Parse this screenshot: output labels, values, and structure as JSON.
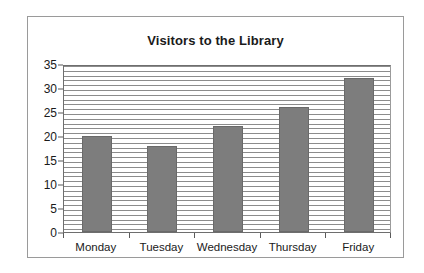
{
  "chart_data": {
    "type": "bar",
    "title": "Visitors to the Library",
    "xlabel": "",
    "ylabel": "",
    "categories": [
      "Monday",
      "Tuesday",
      "Wednesday",
      "Thursday",
      "Friday"
    ],
    "values": [
      20,
      18,
      22,
      26,
      32
    ],
    "ylim": [
      0,
      35
    ],
    "ytick_labels": [
      "0",
      "5",
      "10",
      "15",
      "20",
      "25",
      "30",
      "35"
    ],
    "ytick_values": [
      0,
      5,
      10,
      15,
      20,
      25,
      30,
      35
    ],
    "grid": "horizontal-dense",
    "gridline_interval": 1,
    "legend": "none",
    "bar_color": "#7d7d7d",
    "plot_background": "#ffffff",
    "frame_color": "#9a9a9a",
    "text_color": "#1a1a1a"
  }
}
